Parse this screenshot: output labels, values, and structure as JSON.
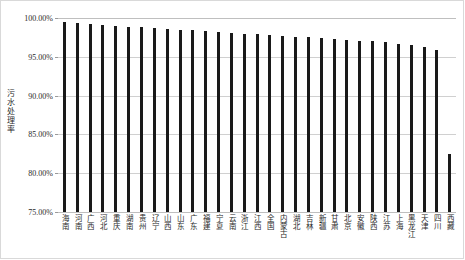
{
  "chart_data": {
    "type": "bar",
    "title": "",
    "xlabel": "",
    "ylabel": "污水处理率",
    "ylim": [
      75,
      100
    ],
    "ytick_labels": [
      "100.00%",
      "95.00%",
      "90.00%",
      "85.00%",
      "80.00%",
      "75.00%"
    ],
    "ytick_values": [
      100,
      95,
      90,
      85,
      80,
      75
    ],
    "grid": true,
    "legend": "none",
    "bar_color": "#1a1a1a",
    "grid_color": "#d0d0d0",
    "categories": [
      "海南",
      "河南",
      "广西",
      "河北",
      "重庆",
      "湖南",
      "贵州",
      "辽宁",
      "山西",
      "山东",
      "广东",
      "福建",
      "宁夏",
      "云南",
      "浙江",
      "江西",
      "全国",
      "内蒙古",
      "湖北",
      "吉林",
      "新疆",
      "甘肃",
      "北京",
      "安徽",
      "陕西",
      "江苏",
      "上海",
      "黑龙江",
      "天津",
      "四川",
      "西藏"
    ],
    "values": [
      99.5,
      99.3,
      99.2,
      99.1,
      99.0,
      98.9,
      98.8,
      98.7,
      98.6,
      98.5,
      98.4,
      98.3,
      98.2,
      98.1,
      98.0,
      97.9,
      97.8,
      97.7,
      97.6,
      97.5,
      97.4,
      97.3,
      97.2,
      97.1,
      97.0,
      96.9,
      96.7,
      96.5,
      96.3,
      95.9,
      82.5
    ]
  }
}
